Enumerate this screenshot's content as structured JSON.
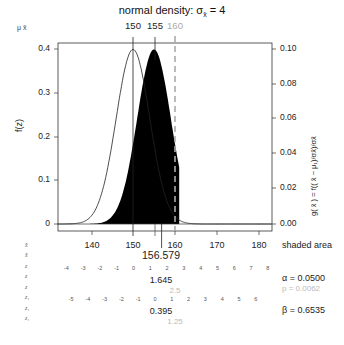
{
  "chart_data": {
    "type": "area",
    "title": "normal density:  σx̄ = 4",
    "xlabel": "x̄",
    "ylabel_left": "f(z)",
    "ylabel_right": "g( x̄ ) = f(( x̄ − μᵢ)/σx̄)/σx̄",
    "top_axis_label": "μ  x̄",
    "top_ticks": [
      {
        "label": "150",
        "x": 150,
        "color": "#222222"
      },
      {
        "label": "155",
        "x": 155,
        "color": "#222222"
      },
      {
        "label": "160",
        "x": 160,
        "color": "#aaaaaa"
      }
    ],
    "xlim": [
      132,
      183
    ],
    "x_ticks": [
      140,
      150,
      160,
      170,
      180
    ],
    "ylim_left": [
      0,
      0.4
    ],
    "y_ticks_left": [
      "0",
      "0.1",
      "0.2",
      "0.3",
      "0.4"
    ],
    "ylim_right": [
      0,
      0.1
    ],
    "y_ticks_right": [
      "0.00",
      "0.02",
      "0.04",
      "0.06",
      "0.08",
      "0.10"
    ],
    "series": [
      {
        "name": "null density (μ0=150)",
        "mean": 150,
        "sd": 4,
        "style": "outline"
      },
      {
        "name": "alternative density (μ1=155)",
        "mean": 155,
        "sd": 4,
        "style": "filled black"
      }
    ],
    "critical_value": 156.579,
    "observed_xbar": 160,
    "shaded_area_label": "shaded area",
    "alpha": "α = 0.0500",
    "p": "p = 0.0062",
    "beta": "β = 0.6535",
    "z_critical": "1.645",
    "z_observed": "2.5",
    "z1_critical": "0.395",
    "z1_observed": "1.25",
    "z_ticks": [
      "-4",
      "-3",
      "-2",
      "-1",
      "0",
      "1",
      "2",
      "3",
      "4",
      "5",
      "6",
      "7",
      "8"
    ],
    "z1_ticks": [
      "-5",
      "-4",
      "-3",
      "-2",
      "-1",
      "0",
      "1",
      "2",
      "3",
      "4",
      "5",
      "6"
    ]
  },
  "labels": {
    "title": "normal density:  σ",
    "title_sub": "x̄",
    "title_tail": " = 4",
    "mu_xbar": "μ  x̄",
    "top150": "150",
    "top155": "155",
    "top160": "160",
    "fz": "f(z)",
    "gx": "g( x̄ ) = f(( x̄ − μ₁)/σx̄)/σx̄",
    "y0": "0",
    "y1": "0.1",
    "y2": "0.2",
    "y3": "0.3",
    "y4": "0.4",
    "r0": "0.00",
    "r1": "0.02",
    "r2": "0.04",
    "r3": "0.06",
    "r4": "0.08",
    "r5": "0.10",
    "x140": "140",
    "x150": "150",
    "x160": "160",
    "x170": "170",
    "x180": "180",
    "shaded": "shaded area",
    "crit": "156.579",
    "zcrit": "1.645",
    "zobs": "2.5",
    "z1crit": "0.395",
    "z1obs": "1.25",
    "alpha": "α = 0.0500",
    "p": "p = 0.0062",
    "beta": "β = 0.6535",
    "row_xbar": "x̄",
    "row_z": "z",
    "row_z1": "z₁"
  }
}
